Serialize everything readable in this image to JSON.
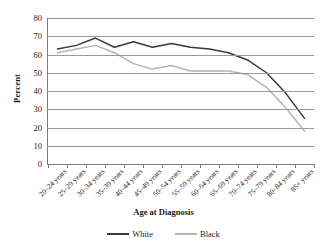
{
  "chart_data": {
    "type": "line",
    "title": "",
    "xlabel": "Age at Diagnosis",
    "ylabel": "Percent",
    "ylim": [
      0,
      80
    ],
    "yticks": [
      0,
      10,
      20,
      30,
      40,
      50,
      60,
      70,
      80
    ],
    "grid": true,
    "legend_position": "bottom",
    "categories": [
      "20–24 years",
      "25–29 years",
      "30–34 years",
      "35–39 years",
      "40–44 years",
      "45–49 years",
      "50–54 years",
      "55–59 years",
      "60–64 years",
      "65–69 years",
      "70–74 years",
      "75–79 years",
      "80–84 years",
      "85+ years"
    ],
    "series": [
      {
        "name": "White",
        "color": "#3a3a3a",
        "values": [
          63,
          65,
          69,
          64,
          67,
          64,
          66,
          64,
          63,
          61,
          57,
          50,
          39,
          25
        ]
      },
      {
        "name": "Black",
        "color": "#b4b4b4",
        "values": [
          61,
          63,
          65,
          61,
          55,
          52,
          54,
          51,
          51,
          51,
          49,
          42,
          31,
          18
        ]
      }
    ]
  },
  "axis": {
    "y_title": "Percent",
    "x_title": "Age at Diagnosis"
  },
  "legend": {
    "items": [
      {
        "label": "White",
        "color": "#3a3a3a"
      },
      {
        "label": "Black",
        "color": "#b4b4b4"
      }
    ]
  }
}
